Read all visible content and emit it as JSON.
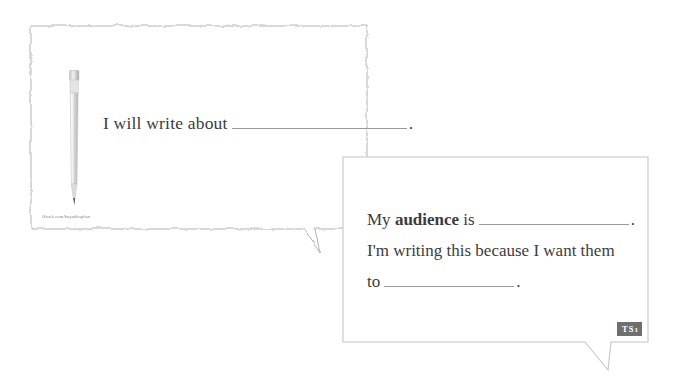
{
  "page": {
    "background_color": "#ffffff",
    "width": 685,
    "height": 381
  },
  "bubble_topic": {
    "name": "topic speech bubble",
    "border_style": "wavy",
    "border_color": "#b8b8b8",
    "fill_color": "#ffffff",
    "prompt_text": "I will write about",
    "blank_fill": "",
    "terminal_punctuation": ".",
    "illustration": {
      "icon": "pencil-icon",
      "description": "mechanical pencil",
      "body_color": "#d7d7d7",
      "tip_color": "#6b6b6b"
    },
    "watermark": "iStock.com/hayatikayhan"
  },
  "bubble_audience": {
    "name": "audience speech bubble",
    "border_style": "straight",
    "border_color": "#c9c9c9",
    "fill_color": "#ffffff",
    "lines": [
      {
        "id": "audience",
        "before": "My",
        "emphasis": "audience",
        "after": "is",
        "blank_fill": "",
        "terminal_punctuation": "."
      },
      {
        "id": "purpose",
        "text": "I'm writing this because I want them"
      },
      {
        "id": "purpose_cont",
        "before": "to",
        "blank_fill": "",
        "terminal_punctuation": "."
      }
    ],
    "badge": {
      "label": "TS",
      "subscript": "1",
      "background_color": "#6f6f6f",
      "text_color": "#ffffff"
    }
  }
}
